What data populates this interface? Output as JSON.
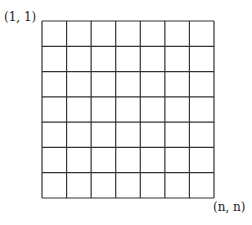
{
  "diagram": {
    "type": "grid",
    "rows": 7,
    "cols": 7,
    "corner_labels": {
      "top_left": "(1, 1)",
      "bottom_right": "(n, n)"
    },
    "grid": {
      "left": 42,
      "top": 21,
      "right": 214,
      "bottom": 198,
      "line_color": "#333333",
      "line_width": 1.2
    }
  }
}
